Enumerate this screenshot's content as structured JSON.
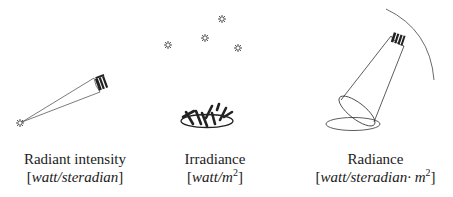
{
  "panels": [
    {
      "id": "radiant-intensity",
      "title": "Radiant intensity",
      "unit_open": "[",
      "unit_italic": "watt/steradian",
      "unit_close": "]"
    },
    {
      "id": "irradiance",
      "title": "Irradiance",
      "unit_open": "[",
      "unit_italic": "watt/m",
      "unit_sup": "2",
      "unit_close": "]"
    },
    {
      "id": "radiance",
      "title": "Radiance",
      "unit_open": "[",
      "unit_italic": "watt/steradian· m",
      "unit_sup": "2",
      "unit_close": "]"
    }
  ],
  "icons": {
    "source": "sun-icon",
    "detector": "sensor-icon",
    "surface": "surface-ellipse-icon",
    "sphere": "sphere-arc-icon"
  },
  "colors": {
    "line": "#333333",
    "text": "#1a1a1a",
    "background": "#ffffff"
  }
}
